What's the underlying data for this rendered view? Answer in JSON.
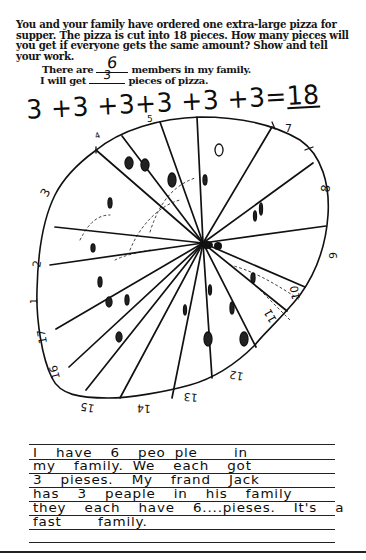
{
  "worksheet": {
    "prompt_lines": [
      "You and your family have ordered one extra-large pizza for",
      "supper. The pizza is cut into 18 pieces. How many pieces will",
      "you get if everyone gets the same amount?  Show and tell",
      "your work."
    ],
    "fill_in": {
      "members_prefix": "There are",
      "members_value": "6",
      "members_suffix": "members in my family.",
      "pieces_prefix": "I will get",
      "pieces_value": "3",
      "pieces_suffix": "pieces of pizza."
    }
  },
  "work": {
    "equation_terms": "3 +3 +3+3 +3 +3=",
    "equation_result": "18"
  },
  "pizza_drawing": {
    "total_slices": 18,
    "rim_labels": [
      "1",
      "2",
      "3",
      "4",
      "5",
      "6",
      "7",
      "8",
      "9",
      "10",
      "11",
      "12",
      "13",
      "14",
      "15",
      "16",
      "17",
      "18"
    ]
  },
  "written_explanation": {
    "lines": [
      "I  have  6  peo ple    in",
      "my  family. We  each  got",
      "3  pieses.  My  frand  Jack",
      "has  3  peaple  in  his  family",
      "they  each  have  6....pieses.  It's  a",
      "fast    family."
    ]
  },
  "colors": {
    "ink": "#111111",
    "paper": "#ffffff"
  }
}
